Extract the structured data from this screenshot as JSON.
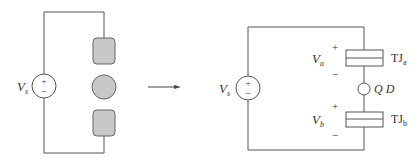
{
  "left_circuit": {
    "source_label": "V",
    "source_subscript": "s",
    "source_plus": "+",
    "source_minus": "−",
    "components": [
      "rounded-rect-electrode-top",
      "circle-dot",
      "rounded-rect-electrode-bottom"
    ]
  },
  "arrow": {
    "direction": "right"
  },
  "right_circuit": {
    "source_label": "V",
    "source_subscript": "s",
    "source_plus": "+",
    "source_minus": "−",
    "va_label": "V",
    "va_subscript": "a",
    "va_plus": "+",
    "va_minus": "−",
    "vb_label": "V",
    "vb_subscript": "b",
    "vb_plus": "+",
    "vb_minus": "−",
    "tja_label": "TJ",
    "tja_subscript": "a",
    "tjb_label": "TJ",
    "tjb_subscript": "b",
    "qd_label": "Q D"
  },
  "colors": {
    "wire": "#555555",
    "fill_gray": "#c8c8c8",
    "text": "#333333"
  }
}
